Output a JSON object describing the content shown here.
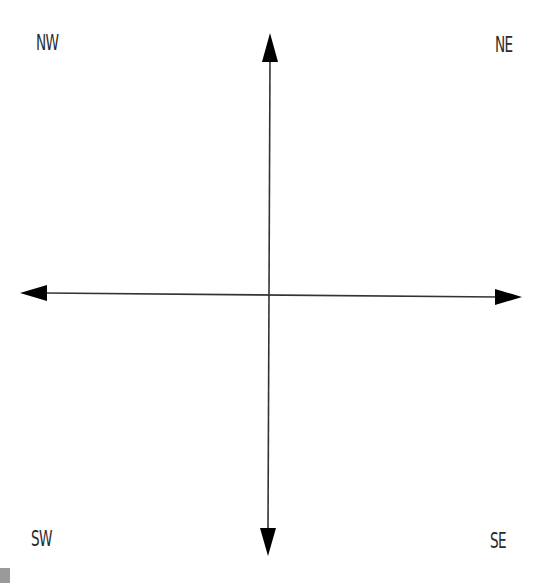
{
  "diagram": {
    "type": "compass-quadrant-axes",
    "labels": {
      "nw": "NW",
      "ne": "NE",
      "sw": "SW",
      "se": "SE"
    },
    "colors": {
      "background": "#ffffff",
      "axis_line": "#333333",
      "arrowhead": "#000000",
      "label_text": "#2a2a2a"
    },
    "axes": {
      "vertical": {
        "top_tip": [
          270,
          33
        ],
        "bottom_tip": [
          268,
          556
        ],
        "arrowheads": [
          "up",
          "down"
        ]
      },
      "horizontal": {
        "left_tip": [
          20,
          293
        ],
        "right_tip": [
          522,
          297
        ],
        "arrowheads": [
          "left",
          "right"
        ]
      },
      "intersection": [
        269,
        294
      ]
    }
  }
}
